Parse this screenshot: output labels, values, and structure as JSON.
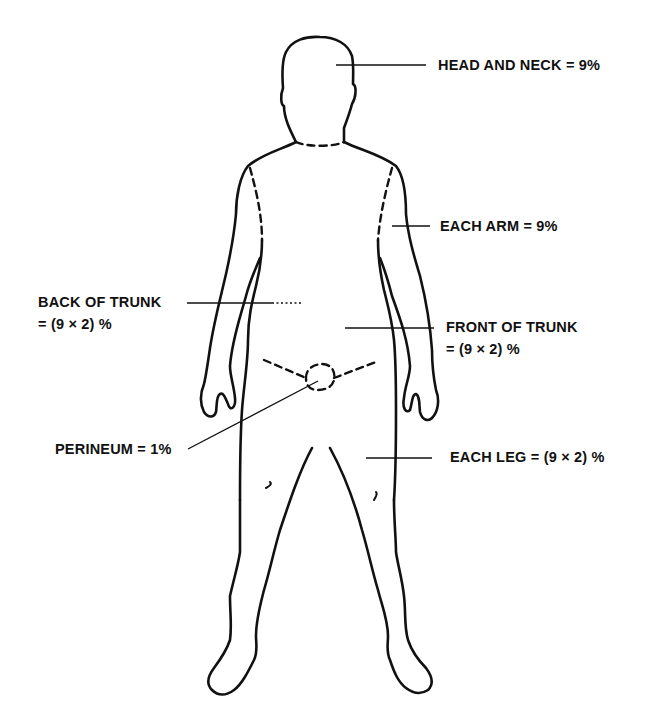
{
  "diagram": {
    "colors": {
      "ink": "#111111",
      "background": "#ffffff"
    },
    "labels": {
      "head_neck": {
        "text": "HEAD AND NECK = 9%"
      },
      "each_arm": {
        "text": "EACH ARM = 9%"
      },
      "back_trunk": {
        "line1": "BACK OF TRUNK",
        "line2": "= (9 × 2) %"
      },
      "front_trunk": {
        "line1": "FRONT OF TRUNK",
        "line2": "= (9 × 2) %"
      },
      "perineum": {
        "text": "PERINEUM = 1%"
      },
      "each_leg": {
        "text": "EACH LEG = (9 × 2) %"
      }
    },
    "regions": [
      {
        "name": "Head and neck",
        "percent": 9
      },
      {
        "name": "Each arm",
        "percent": 9
      },
      {
        "name": "Back of trunk",
        "percent": 18
      },
      {
        "name": "Front of trunk",
        "percent": 18
      },
      {
        "name": "Perineum",
        "percent": 1
      },
      {
        "name": "Each leg",
        "percent": 18
      }
    ]
  }
}
